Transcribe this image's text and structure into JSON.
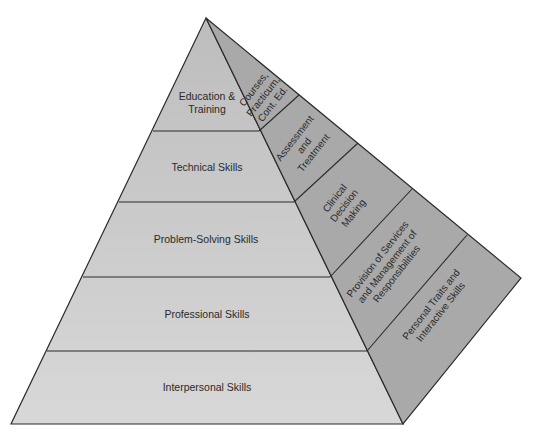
{
  "diagram": {
    "type": "pyramid",
    "colors": {
      "left_face": "#c9c9c9",
      "left_face_bottom": "#d6d6d6",
      "right_face": "#a9a9a9",
      "stroke": "#2b2b2b",
      "text": "#2a2a2a",
      "background": "#ffffff"
    },
    "left_face_layers": [
      {
        "label_lines": [
          "Education &",
          "Training"
        ]
      },
      {
        "label_lines": [
          "Technical Skills"
        ]
      },
      {
        "label_lines": [
          "Problem-Solving Skills"
        ]
      },
      {
        "label_lines": [
          "Professional Skills"
        ]
      },
      {
        "label_lines": [
          "Interpersonal Skills"
        ]
      }
    ],
    "right_face_layers": [
      {
        "label_lines": [
          "Courses,",
          "Practicum,",
          "Cont. Ed."
        ]
      },
      {
        "label_lines": [
          "Assessment",
          "and",
          "Treatment"
        ]
      },
      {
        "label_lines": [
          "Clinical",
          "Decision",
          "Making"
        ]
      },
      {
        "label_lines": [
          "Provision of Services",
          "and Management of",
          "Responsibilities"
        ]
      },
      {
        "label_lines": [
          "Personal Traits and",
          "Interactive Skills"
        ]
      }
    ]
  }
}
